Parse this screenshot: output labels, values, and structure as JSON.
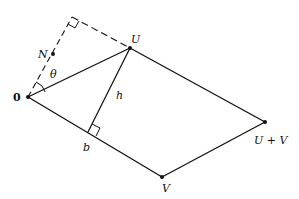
{
  "diagram": {
    "colors": {
      "stroke": "#111111",
      "background": "#ffffff"
    },
    "points": {
      "origin": {
        "label": "0",
        "x": 28,
        "y": 97
      },
      "U": {
        "label": "U",
        "x": 130,
        "y": 48
      },
      "V": {
        "label": "V",
        "x": 162,
        "y": 177
      },
      "UplusV": {
        "label": "U + V",
        "x": 265,
        "y": 122
      },
      "N": {
        "label": "N",
        "x": 53,
        "y": 54
      },
      "corner": {
        "x": 72,
        "y": 17
      },
      "foot": {
        "label": "b",
        "x": 88,
        "y": 132
      }
    },
    "labels": {
      "origin": "0",
      "U": "U",
      "V": "V",
      "UplusV": "U + V",
      "N": "N",
      "theta": "θ",
      "h": "h",
      "b": "b"
    }
  }
}
